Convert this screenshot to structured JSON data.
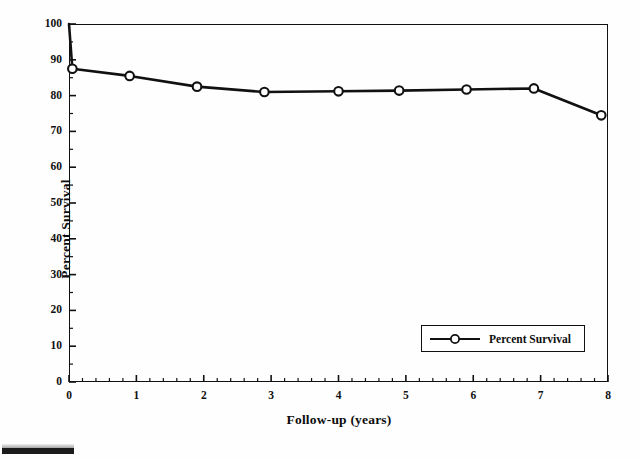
{
  "chart_data": {
    "type": "line",
    "title": "",
    "subtitle": "",
    "xlabel": "Follow-up (years)",
    "ylabel": "Percent Survival",
    "xlim": [
      0,
      8
    ],
    "ylim": [
      0,
      100
    ],
    "xticks": [
      0,
      1,
      2,
      3,
      4,
      5,
      6,
      7,
      8
    ],
    "xtick_labels": [
      "0",
      "1",
      "2",
      "3",
      "4",
      "5",
      "6",
      "7",
      "8"
    ],
    "yticks": [
      0,
      10,
      20,
      30,
      40,
      50,
      60,
      70,
      80,
      90,
      100
    ],
    "ytick_labels": [
      "0",
      "10",
      "20",
      "30",
      "40",
      "50",
      "60",
      "70",
      "80",
      "90",
      "100"
    ],
    "x_minor_per_interval": 5,
    "y_minor_per_interval": 2,
    "grid": false,
    "legend_position": "lower right",
    "series": [
      {
        "name": "Percent Survival",
        "marker": "open-circle",
        "color": "#111111",
        "x": [
          0,
          0.05,
          0.9,
          1.9,
          2.9,
          4.0,
          4.9,
          5.9,
          6.9,
          7.9
        ],
        "y": [
          100,
          87.5,
          85.5,
          82.5,
          81.0,
          81.2,
          81.4,
          81.7,
          82.0,
          74.5
        ],
        "marker_points": [
          {
            "x": 0.05,
            "y": 87.5
          },
          {
            "x": 0.9,
            "y": 85.5
          },
          {
            "x": 1.9,
            "y": 82.5
          },
          {
            "x": 2.9,
            "y": 81.0
          },
          {
            "x": 4.0,
            "y": 81.2
          },
          {
            "x": 4.9,
            "y": 81.4
          },
          {
            "x": 5.9,
            "y": 81.7
          },
          {
            "x": 6.9,
            "y": 82.0
          },
          {
            "x": 7.9,
            "y": 74.5
          }
        ]
      }
    ]
  },
  "legend": {
    "entries": [
      {
        "label": "Percent Survival"
      }
    ]
  },
  "axes": {
    "x_title": "Follow-up (years)",
    "y_title": "Percent Survival"
  }
}
